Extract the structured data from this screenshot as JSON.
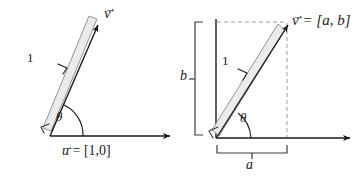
{
  "figure": {
    "colors": {
      "stroke": "#1a1a1a",
      "ruler_fill": "#ebebeb",
      "ruler_edge": "#8a8a8a",
      "dashed": "#9a9a9a",
      "background": "#ffffff"
    },
    "panels": [
      {
        "id": "left",
        "name": "unit-vector-panel",
        "vector_label": "v",
        "vector_label_accent": "→",
        "length_label": "1",
        "angle_label": "θ",
        "axis_label": "= [1,0]",
        "axis_label_symbol": "u",
        "axis_label_full": "u⃗ = [1,0]"
      },
      {
        "id": "right",
        "name": "components-panel",
        "vector_label_symbol": "v",
        "vector_label": "= [a, b]",
        "vector_label_full": "v⃗ = [a, b]",
        "length_label": "1",
        "angle_label": "θ",
        "vertical_component_label": "b",
        "horizontal_component_label": "a"
      }
    ]
  }
}
